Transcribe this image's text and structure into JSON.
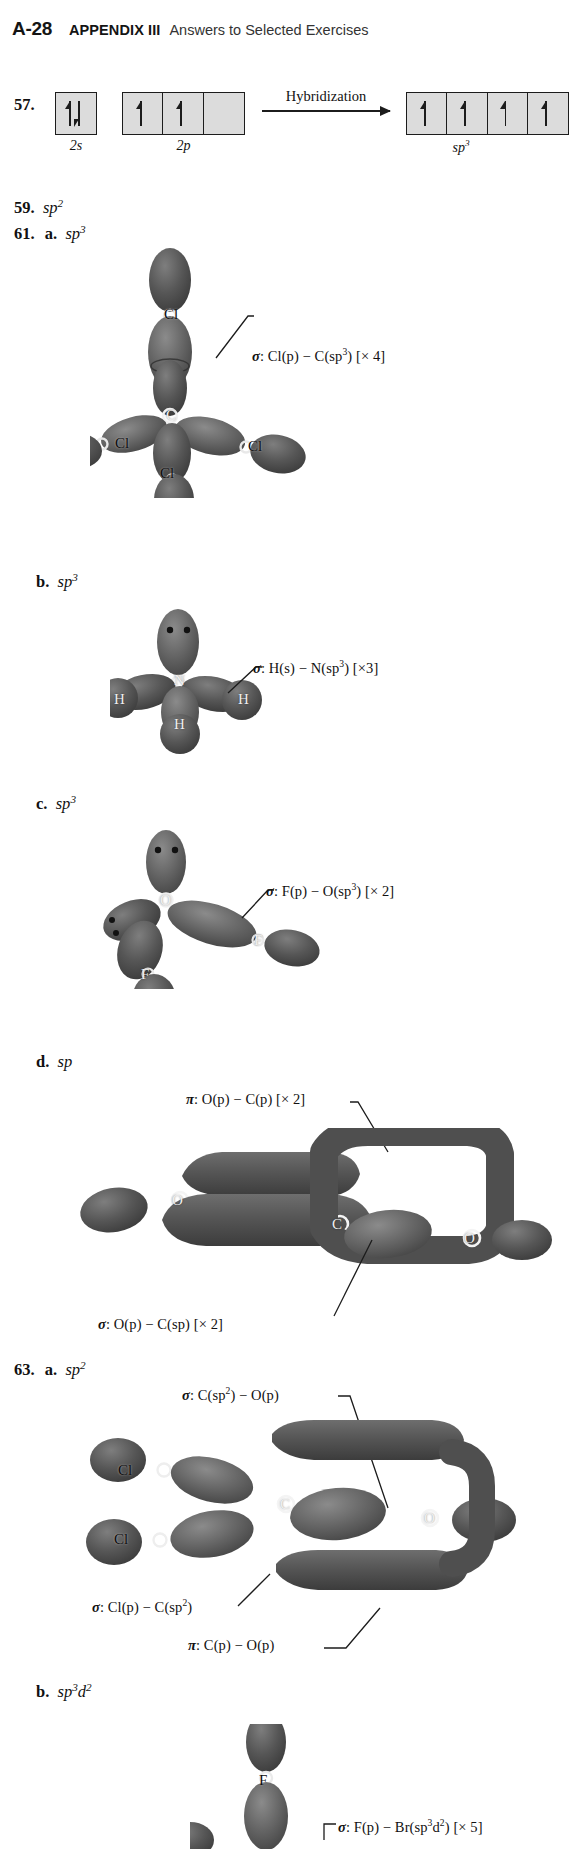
{
  "header": {
    "folio": "A-28",
    "appendix": "APPENDIX III",
    "subtitle": "Answers to Selected Exercises"
  },
  "problems": {
    "p57": {
      "number": "57.",
      "orbitals": [
        {
          "name": "2s",
          "label_base": "2s",
          "boxes": [
            {
              "electrons": "pair"
            }
          ]
        },
        {
          "name": "2p",
          "label_base": "2p",
          "boxes": [
            {
              "electrons": "single"
            },
            {
              "electrons": "single"
            },
            {
              "electrons": "empty"
            }
          ]
        },
        {
          "name": "sp3",
          "label_base": "sp",
          "label_sup": "3",
          "boxes": [
            {
              "electrons": "single"
            },
            {
              "electrons": "single"
            },
            {
              "electrons": "single"
            },
            {
              "electrons": "single"
            }
          ]
        }
      ],
      "reaction_label": "Hybridization"
    },
    "p59": {
      "number": "59.",
      "answer_base": "sp",
      "answer_sup": "2"
    },
    "p61": {
      "number": "61.",
      "parts": [
        {
          "letter": "a.",
          "answer_base": "sp",
          "answer_sup": "3",
          "molecule": "CCl4",
          "atoms": [
            "Cl",
            "C",
            "Cl",
            "Cl",
            "Cl"
          ],
          "callouts": [
            {
              "sigma": "σ",
              "text": ": Cl(p) − C(sp",
              "sup": "3",
              "tail": ") [× 4]"
            }
          ]
        },
        {
          "letter": "b.",
          "answer_base": "sp",
          "answer_sup": "3",
          "molecule": "NH3",
          "atoms": [
            "N",
            "H",
            "H",
            "H"
          ],
          "callouts": [
            {
              "sigma": "σ",
              "text": ": H(s) − N(sp",
              "sup": "3",
              "tail": ") [×3]"
            }
          ]
        },
        {
          "letter": "c.",
          "answer_base": "sp",
          "answer_sup": "3",
          "molecule": "OF2",
          "atoms": [
            "O",
            "F",
            "F"
          ],
          "callouts": [
            {
              "sigma": "σ",
              "text": ": F(p) − O(sp",
              "sup": "3",
              "tail": ") [× 2]"
            }
          ]
        },
        {
          "letter": "d.",
          "answer_base": "sp",
          "answer_sup": "",
          "molecule": "CO2",
          "atoms": [
            "O",
            "C",
            "O"
          ],
          "callouts": [
            {
              "sigma": "π",
              "text": ": O(p) − C(p) [× 2]",
              "sup": "",
              "tail": ""
            },
            {
              "sigma": "σ",
              "text": ": O(p) − C(sp) [× 2]",
              "sup": "",
              "tail": ""
            }
          ]
        }
      ]
    },
    "p63": {
      "number": "63.",
      "parts": [
        {
          "letter": "a.",
          "answer_base": "sp",
          "answer_sup": "2",
          "molecule": "COCl2",
          "atoms": [
            "Cl",
            "Cl",
            "C",
            "O"
          ],
          "callouts": [
            {
              "sigma": "σ",
              "text": ": C(sp",
              "sup": "2",
              "tail": ") − O(p)"
            },
            {
              "sigma": "σ",
              "text": ": Cl(p) − C(sp",
              "sup": "2",
              "tail": ")"
            },
            {
              "sigma": "π",
              "text": ": C(p) − O(p)",
              "sup": "",
              "tail": ""
            }
          ]
        },
        {
          "letter": "b.",
          "answer_base": "sp",
          "answer_sup": "3",
          "answer_base2": "d",
          "answer_sup2": "2",
          "molecule": "BrF5",
          "atoms": [
            "F"
          ],
          "callouts": [
            {
              "sigma": "σ",
              "text": ": F(p) − Br(sp",
              "sup": "3",
              "mid": "d",
              "sup2": "2",
              "tail": ") [× 5]"
            }
          ]
        }
      ]
    }
  },
  "colors": {
    "lobe_dark": "#4a4a4a",
    "lobe_mid": "#5c5c5c",
    "lobe_light": "#7a7a7a",
    "ink": "#111111",
    "box_fill": "#dcdcdc"
  }
}
